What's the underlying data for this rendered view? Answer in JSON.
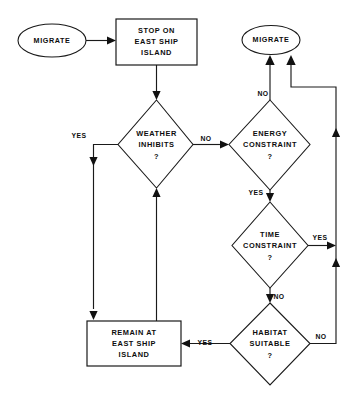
{
  "diagram": {
    "canvas": {
      "width": 352,
      "height": 407
    },
    "stroke_color": "#1a1a1a",
    "text_color": "#0d0d0d",
    "background_color": "#ffffff"
  },
  "nodes": {
    "start_migrate": {
      "type": "terminal",
      "label": "MIGRATE",
      "lines": [
        "MIGRATE"
      ]
    },
    "stop_on_east_ship_island": {
      "type": "process",
      "label": "STOP ON EAST SHIP ISLAND",
      "lines": [
        "STOP ON",
        "EAST SHIP",
        "ISLAND"
      ]
    },
    "end_migrate": {
      "type": "terminal",
      "label": "MIGRATE",
      "lines": [
        "MIGRATE"
      ]
    },
    "weather_inhibits": {
      "type": "decision",
      "label": "WEATHER INHIBITS ?",
      "lines": [
        "WEATHER",
        "INHIBITS",
        "?"
      ]
    },
    "energy_constraint": {
      "type": "decision",
      "label": "ENERGY CONSTRAINT ?",
      "lines": [
        "ENERGY",
        "CONSTRAINT",
        "?"
      ]
    },
    "time_constraint": {
      "type": "decision",
      "label": "TIME CONSTRAINT ?",
      "lines": [
        "TIME",
        "CONSTRAINT",
        "?"
      ]
    },
    "habitat_suitable": {
      "type": "decision",
      "label": "HABITAT SUITABLE ?",
      "lines": [
        "HABITAT",
        "SUITABLE",
        "?"
      ]
    },
    "remain_at_east_ship_island": {
      "type": "process",
      "label": "REMAIN AT EAST SHIP ISLAND",
      "lines": [
        "REMAIN AT",
        "EAST SHIP",
        "ISLAND"
      ]
    }
  },
  "edge_labels": {
    "weather_yes": "YES",
    "weather_no": "NO",
    "energy_no": "NO",
    "energy_yes": "YES",
    "time_yes": "YES",
    "time_no": "NO",
    "habitat_yes": "YES",
    "habitat_no": "NO"
  }
}
